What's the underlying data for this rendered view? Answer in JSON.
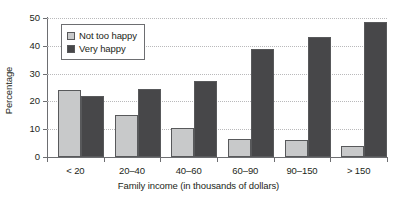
{
  "chart_data": {
    "type": "bar",
    "title": "",
    "xlabel": "Family income (in thousands of dollars)",
    "ylabel": "Percentage",
    "categories": [
      "< 20",
      "20–40",
      "40–60",
      "60–90",
      "90–150",
      "> 150"
    ],
    "series": [
      {
        "name": "Not too happy",
        "color": "#c8c9ca",
        "values": [
          24,
          15,
          10.5,
          6.5,
          6,
          4
        ]
      },
      {
        "name": "Very happy",
        "color": "#474749",
        "values": [
          22,
          24.5,
          27.5,
          39,
          43,
          48.5
        ]
      }
    ],
    "ylim": [
      0,
      50
    ],
    "yticks": [
      0,
      10,
      20,
      30,
      40,
      50
    ],
    "grid": true,
    "legend_position": "top-left"
  }
}
